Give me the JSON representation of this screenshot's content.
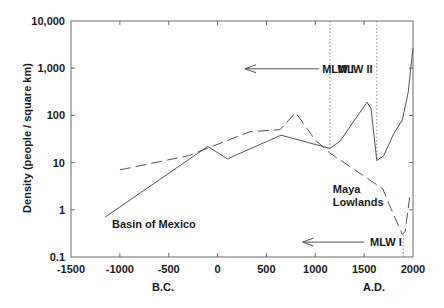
{
  "chart_data": {
    "type": "line",
    "title": "",
    "xlabel": "",
    "ylabel": "Density (people / square km)",
    "yscale": "log",
    "xlim": [
      -1500,
      2000
    ],
    "ylim": [
      0.1,
      10000
    ],
    "grid": false,
    "x_ticks": [
      -1500,
      -1000,
      -500,
      0,
      500,
      1000,
      1500,
      2000
    ],
    "x_tick_labels": [
      "-1500",
      "-1000",
      "-500",
      "0",
      "500",
      "1000",
      "1500",
      "2000"
    ],
    "y_ticks": [
      0.1,
      1,
      10,
      100,
      1000,
      10000
    ],
    "y_tick_labels": [
      "0.1",
      "1",
      "10",
      "100",
      "1,000",
      "10,000"
    ],
    "era_labels": {
      "bc": "B.C.",
      "ad": "A.D."
    },
    "series": [
      {
        "name": "Basin of Mexico",
        "style": "solid",
        "points": [
          [
            -1150,
            0.7
          ],
          [
            -100,
            22
          ],
          [
            100,
            12
          ],
          [
            650,
            38
          ],
          [
            1150,
            20
          ],
          [
            1250,
            28
          ],
          [
            1530,
            190
          ],
          [
            1570,
            140
          ],
          [
            1630,
            11
          ],
          [
            1700,
            14
          ],
          [
            1800,
            40
          ],
          [
            1890,
            80
          ],
          [
            1950,
            300
          ],
          [
            2000,
            2700
          ]
        ]
      },
      {
        "name": "Maya Lowlands",
        "style": "dashed",
        "points": [
          [
            -1000,
            7
          ],
          [
            -300,
            14
          ],
          [
            330,
            45
          ],
          [
            640,
            50
          ],
          [
            800,
            115
          ],
          [
            1000,
            30
          ],
          [
            1150,
            16
          ],
          [
            1690,
            2.8
          ],
          [
            1780,
            1.0
          ],
          [
            1890,
            0.3
          ],
          [
            1920,
            0.35
          ],
          [
            1970,
            2.2
          ]
        ]
      }
    ],
    "annotations": [
      {
        "text": "Basin of Mexico",
        "x": -1080,
        "y": 0.42
      },
      {
        "text": "Maya",
        "x": 1180,
        "y": 2.3
      },
      {
        "text": "Lowlands",
        "x": 1180,
        "y": 1.2
      },
      {
        "text": "MLW I",
        "x": 1070,
        "y": 800,
        "arrow_from": 1040,
        "arrow_to": 280,
        "arrow_y": 800
      },
      {
        "text": "MLW II",
        "x": 1230,
        "y": 800
      },
      {
        "text": "MLW I",
        "x": 1560,
        "y": 0.17,
        "arrow_from": 1500,
        "arrow_to": 870,
        "arrow_y": 0.17
      }
    ],
    "vertical_markers": [
      {
        "x": 1150,
        "style": "dotted",
        "from_y": 10000,
        "to_y": 20
      },
      {
        "x": 1630,
        "style": "dotted",
        "from_y": 10000,
        "to_y": 11
      },
      {
        "x": 1900,
        "style": "dotted",
        "from_y": 0.3,
        "to_y": 0.1
      }
    ]
  }
}
